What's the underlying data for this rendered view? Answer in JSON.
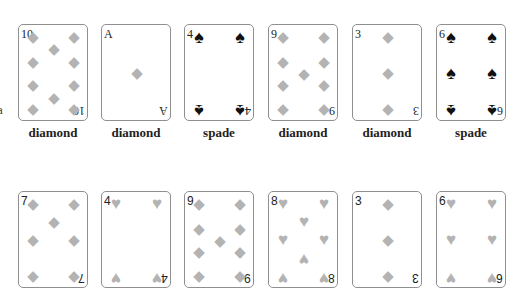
{
  "edge_text": "a",
  "colors": {
    "pip_light": "#b3b3b3",
    "pip_dark": "#111111",
    "card_border": "#8f8f8f",
    "label": "#222222"
  },
  "rows": [
    {
      "cards": [
        {
          "rank": "10",
          "suit": "diamond",
          "suit_icon": "diamond-icon",
          "label": "diamond"
        },
        {
          "rank": "A",
          "suit": "diamond",
          "suit_icon": "diamond-icon",
          "label": "diamond"
        },
        {
          "rank": "4",
          "suit": "spade",
          "suit_icon": "spade-icon",
          "label": "spade"
        },
        {
          "rank": "9",
          "suit": "diamond",
          "suit_icon": "diamond-icon",
          "label": "diamond"
        },
        {
          "rank": "3",
          "suit": "diamond",
          "suit_icon": "diamond-icon",
          "label": "diamond"
        },
        {
          "rank": "6",
          "suit": "spade",
          "suit_icon": "spade-icon",
          "label": "spade"
        }
      ]
    },
    {
      "cards": [
        {
          "rank": "7",
          "suit": "diamond",
          "suit_icon": "diamond-icon"
        },
        {
          "rank": "4",
          "suit": "heart",
          "suit_icon": "heart-icon"
        },
        {
          "rank": "9",
          "suit": "diamond",
          "suit_icon": "diamond-icon"
        },
        {
          "rank": "8",
          "suit": "heart",
          "suit_icon": "heart-icon"
        },
        {
          "rank": "3",
          "suit": "diamond",
          "suit_icon": "diamond-icon"
        },
        {
          "rank": "6",
          "suit": "heart",
          "suit_icon": "heart-icon"
        }
      ]
    }
  ]
}
